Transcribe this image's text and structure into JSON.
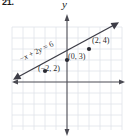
{
  "problem": {
    "number": "21."
  },
  "axes": {
    "y_label": "y",
    "x_label": "",
    "x_range": [
      -5,
      5
    ],
    "y_range": [
      -4,
      5
    ],
    "grid": true,
    "grid_color": "#dfe3ea",
    "axis_color": "#4a4a52"
  },
  "labels": {
    "equation_html": "&minus;<span class=\"ital\">x</span> + 2<span class=\"ital\">y</span> = 6",
    "equation_text": "-x + 2y = 6",
    "point_0_3": "(0, 3)",
    "point_2_4": "(2, 4)",
    "point_m2_2": "(−2, 2)"
  },
  "chart_data": {
    "type": "line",
    "title": "",
    "xlabel": "",
    "ylabel": "y",
    "xlim": [
      -5,
      5
    ],
    "ylim": [
      -4,
      5
    ],
    "grid": true,
    "equation": "-x + 2y = 6",
    "slope": 0.5,
    "y_intercept": 3,
    "series": [
      {
        "name": "-x + 2y = 6",
        "type": "line",
        "x": [
          -5,
          5
        ],
        "y": [
          0.5,
          5.5
        ],
        "arrows": "both",
        "color": "#3c3c46"
      }
    ],
    "points": [
      {
        "label": "(−2, 2)",
        "x": -2,
        "y": 2
      },
      {
        "label": "(0, 3)",
        "x": 0,
        "y": 3
      },
      {
        "label": "(2, 4)",
        "x": 2,
        "y": 4
      }
    ],
    "legend": null
  },
  "colors": {
    "grid": "#dfe3ea",
    "axis": "#4a4a52",
    "line": "#3c3c46",
    "text": "#1a1a1a"
  }
}
